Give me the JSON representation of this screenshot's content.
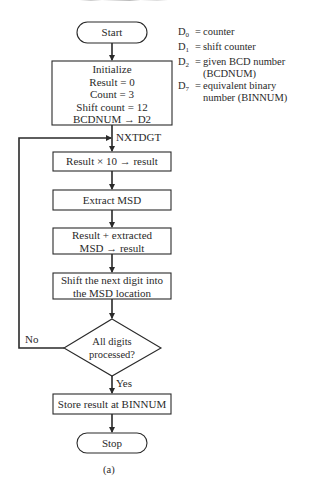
{
  "diagram": {
    "type": "flowchart",
    "caption": "(a)",
    "nodes": {
      "start": {
        "shape": "terminator",
        "label": "Start"
      },
      "init": {
        "shape": "process",
        "lines": [
          "Initialize",
          "Result = 0",
          "Count = 3",
          "Shift count = 12",
          "BCDNUM → D2"
        ]
      },
      "multiply": {
        "shape": "process",
        "label": "Result × 10 → result"
      },
      "extract": {
        "shape": "process",
        "label": "Extract MSD"
      },
      "add": {
        "shape": "process",
        "lines": [
          "Result + extracted",
          "MSD → result"
        ]
      },
      "shift": {
        "shape": "process",
        "lines": [
          "Shift the next digit into",
          "the MSD location"
        ]
      },
      "decision": {
        "shape": "decision",
        "lines": [
          "All digits",
          "processed?"
        ]
      },
      "store": {
        "shape": "process",
        "label": "Store result at BINNUM"
      },
      "stop": {
        "shape": "terminator",
        "label": "Stop"
      }
    },
    "edge_labels": {
      "loop_entry": "NXTDGT",
      "no": "No",
      "yes": "Yes"
    },
    "edges": [
      [
        "start",
        "init"
      ],
      [
        "init",
        "multiply"
      ],
      [
        "multiply",
        "extract"
      ],
      [
        "extract",
        "add"
      ],
      [
        "add",
        "shift"
      ],
      [
        "shift",
        "decision"
      ],
      [
        "decision",
        "store",
        "Yes"
      ],
      [
        "decision",
        "multiply",
        "No"
      ],
      [
        "store",
        "stop"
      ]
    ],
    "legend": [
      {
        "key": "D",
        "sub": "0",
        "value": "counter"
      },
      {
        "key": "D",
        "sub": "1",
        "value": "shift counter"
      },
      {
        "key": "D",
        "sub": "2",
        "value": "given BCD number (BCDNUM)"
      },
      {
        "key": "D",
        "sub": "7",
        "value": "equivalent binary number (BINNUM)"
      }
    ],
    "legend_eq": "="
  },
  "colors": {
    "line": "#2a2a2a",
    "background": "#ffffff"
  }
}
